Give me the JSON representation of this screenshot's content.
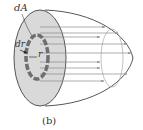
{
  "figure": {
    "caption": "(b)",
    "labels": {
      "dA": "dA",
      "dr": "dr",
      "r": "r"
    },
    "colors": {
      "disk_fill": "#d9d9d9",
      "ring": "#6e6e6e",
      "outline": "#444444",
      "arrows": "#888888"
    }
  }
}
